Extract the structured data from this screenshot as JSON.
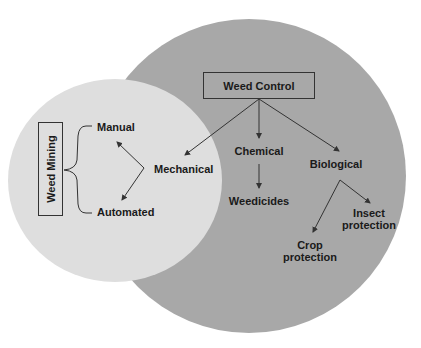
{
  "diagram": {
    "type": "venn-concept-map",
    "colors": {
      "outer_circle": "#a8a8a8",
      "inner_circle": "#dedede",
      "lines": "#333333",
      "text": "#1a1a1a",
      "background": "#ffffff"
    },
    "weed_control": {
      "title": "Weed Control",
      "branches": {
        "mechanical": "Mechanical",
        "chemical": "Chemical",
        "biological": "Biological"
      },
      "chemical_children": [
        "Weedicides"
      ],
      "biological_children": {
        "crop": [
          "Crop",
          "protection"
        ],
        "insect": [
          "Insect",
          "protection"
        ]
      }
    },
    "weed_mining": {
      "title": "Weed Mining",
      "children": [
        "Manual",
        "Automated"
      ]
    }
  }
}
